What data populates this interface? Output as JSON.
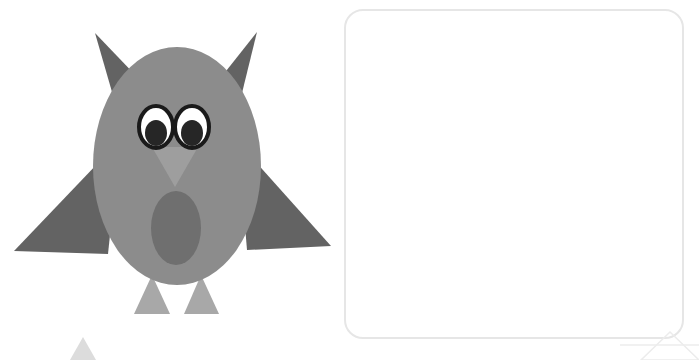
{
  "canvas": {
    "width": 699,
    "height": 360,
    "background": "#ffffff",
    "title": "owl-drawing-canvas"
  },
  "palette": {
    "body_gray": "#8c8c8c",
    "dark_gray": "#636363",
    "belly_gray": "#6f6f6f",
    "light_gray": "#a8a8a8",
    "beak_gray": "#9e9e9e",
    "eye_white": "#ffffff",
    "eye_black": "#1a1a1a",
    "pupil_black": "#262626",
    "panel_border": "#e6e6e6",
    "faint_outline": "#f0f0f0",
    "faint_fill": "#dcdcdc",
    "background": "#ffffff"
  },
  "owl": {
    "label": "owl-figure",
    "body": {
      "cx": 177,
      "cy": 166,
      "rx": 84,
      "ry": 119,
      "fill": "#8c8c8c"
    },
    "ear_left": {
      "points": "95,33 140,80 112,92",
      "fill": "#636363"
    },
    "ear_right": {
      "points": "257,32 215,85 242,93",
      "fill": "#636363"
    },
    "wing_left": {
      "points": "120,140 108,254 14,251",
      "fill": "#636363"
    },
    "wing_right": {
      "points": "238,142 247,250 331,246",
      "fill": "#636363"
    },
    "eye_left": {
      "cx": 156,
      "cy": 127,
      "rx": 17,
      "ry": 21,
      "fill": "#ffffff",
      "stroke": "#1a1a1a",
      "stroke_width": 4
    },
    "eye_right": {
      "cx": 192,
      "cy": 127,
      "rx": 17,
      "ry": 21,
      "fill": "#ffffff",
      "stroke": "#1a1a1a",
      "stroke_width": 4
    },
    "pupil_left": {
      "cx": 156,
      "cy": 133,
      "rx": 11,
      "ry": 13,
      "fill": "#262626"
    },
    "pupil_right": {
      "cx": 192,
      "cy": 133,
      "rx": 11,
      "ry": 13,
      "fill": "#262626"
    },
    "beak": {
      "points": "152,147 198,147 175,187",
      "fill": "#9e9e9e"
    },
    "belly": {
      "cx": 176,
      "cy": 228,
      "rx": 25,
      "ry": 37,
      "fill": "#6f6f6f"
    },
    "foot_left": {
      "points": "152,275 134,314 170,314",
      "fill": "#a8a8a8"
    },
    "foot_right": {
      "points": "201,275 184,314 219,314",
      "fill": "#a8a8a8"
    }
  },
  "panel": {
    "label": "rounded-rectangle-panel",
    "x": 345,
    "y": 10,
    "width": 338,
    "height": 328,
    "radius": 18,
    "fill": "#ffffff",
    "stroke": "#e6e6e6",
    "stroke_width": 2
  },
  "partial_shapes": [
    {
      "name": "bottom-left-triangle-tip",
      "points": "83,337 70,360 96,360",
      "fill": "#dcdcdc",
      "stroke": "none",
      "stroke_width": 0
    },
    {
      "name": "bottom-right-triangle-outline",
      "points": "670,332 641,360 699,360",
      "fill": "none",
      "stroke": "#ececec",
      "stroke_width": 1.5
    },
    {
      "name": "bottom-right-horizontal-rule",
      "points": "620,345 699,345",
      "fill": "none",
      "stroke": "#ececec",
      "stroke_width": 1.5
    }
  ]
}
